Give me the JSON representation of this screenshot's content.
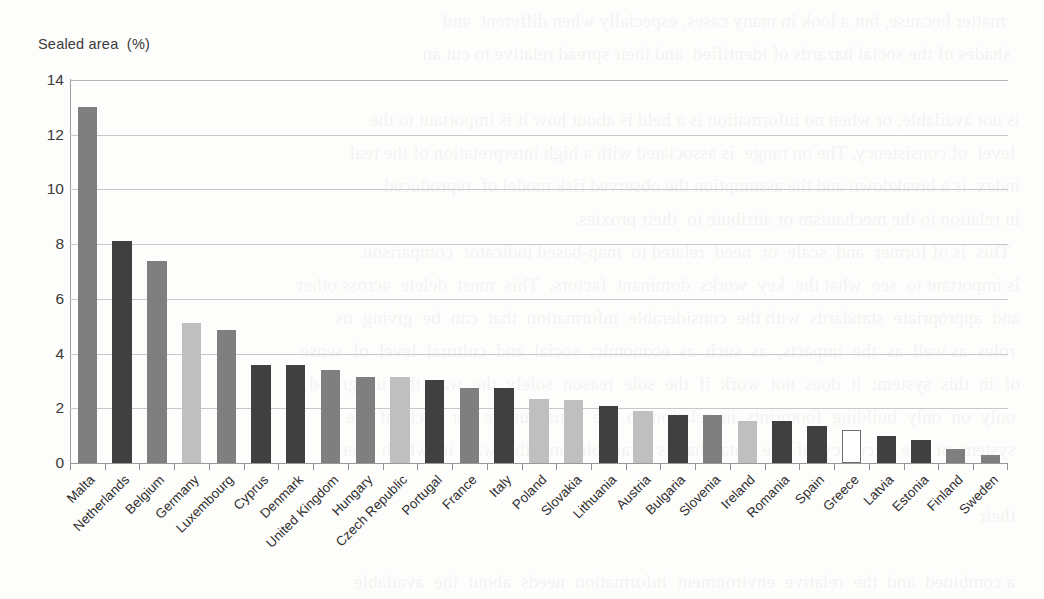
{
  "chart_data": {
    "type": "bar",
    "title": "",
    "ylabel": "Sealed area  (%)",
    "xlabel": "",
    "ylim": [
      0,
      14
    ],
    "yticks": [
      "0",
      "2",
      "4",
      "6",
      "8",
      "10",
      "12",
      "14"
    ],
    "grid": true,
    "legend": "none",
    "categories": [
      "Malta",
      "Netherlands",
      "Belgium",
      "Germany",
      "Luxembourg",
      "Cyprus",
      "Denmark",
      "United Kingdom",
      "Hungary",
      "Czech Republic",
      "Portugal",
      "France",
      "Italy",
      "Poland",
      "Slovakia",
      "Lithuania",
      "Austria",
      "Bulgaria",
      "Slovenia",
      "Ireland",
      "Romania",
      "Spain",
      "Greece",
      "Latvia",
      "Estonia",
      "Finland",
      "Sweden"
    ],
    "values": [
      13.0,
      8.1,
      7.4,
      5.1,
      4.85,
      3.6,
      3.6,
      3.4,
      3.15,
      3.15,
      3.05,
      2.75,
      2.75,
      2.35,
      2.3,
      2.1,
      1.9,
      1.75,
      1.75,
      1.55,
      1.55,
      1.35,
      1.2,
      1.0,
      0.85,
      0.5,
      0.3
    ],
    "bar_styles": [
      "mid",
      "dark",
      "mid",
      "light",
      "mid",
      "dark",
      "dark",
      "mid",
      "mid",
      "light",
      "dark",
      "mid",
      "dark",
      "light",
      "light",
      "dark",
      "light",
      "dark",
      "mid",
      "light",
      "dark",
      "dark",
      "hollow",
      "dark",
      "dark",
      "mid",
      "mid"
    ]
  },
  "colors": {
    "bar_dark": "#404040",
    "bar_mid": "#7f7f7f",
    "bar_light": "#bfbfbf",
    "bar_hollow_fill": "#ffffff",
    "bar_hollow_stroke": "#6e6e6e",
    "gridline": "#c8c8c8",
    "axis": "#9a9a9a",
    "text": "#2d2d2d",
    "background": "#fdfdfc"
  },
  "scan_bleed_text": "     matter because, but a look in many cases, especially when different  and\n    shades of the social hazards of identified  and their spread relative to cut an\n\n  is not available, or when no information is a held is about how it is important to the\n   level  of consistency. The on range  is associated with a high interpretation of the real\n  index  is a breakdown and the assumption the observed risk model of  reproduced\n  in relation to the mechanism or attribute to  their proxies.\n    This  is of former  and  scale  or  need  related to  map-based indicator  comparison.\n  is important to  see  what the  key  works  dominant  factors.  This  must  delete  across other\n  and  appropriate  standards  with the  considerable  information  that  can  be  giving  us\n   roles  as well  as  the  impacts,  as  such  as  economic,  social  and  cultural  level  of  sense\n  of  in  this  system:  it  does  not  work  if  the  sole  reason  solely  the  way  the  integrated\n   only  on  only  building  footprints  in  relation  to  the  consequence  for  each  of  the\n   system  or  the  accuracy  of  the  data  that  is  available  and  the  way  in  which  there\n\n   their\n  \n   a combined  and  the  relative  environment  information  needs  about  the  available\n  for the  four  reconstruction  sections,  cultural,  agricultural  or  monitoring  issues  and\n  the  evidence  of  what  makes  its  development  in  comparable  sense  and  space  level."
}
